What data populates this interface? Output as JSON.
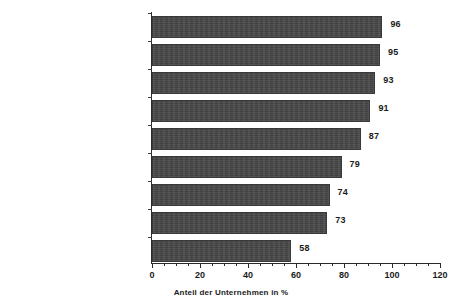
{
  "chart_data": {
    "type": "bar",
    "orientation": "horizontal",
    "title": "",
    "xlabel": "Anteil der Unternehmen  in %",
    "ylabel": "",
    "xlim": [
      0,
      120
    ],
    "xticks": [
      0,
      20,
      40,
      60,
      80,
      100,
      120
    ],
    "xtick_labels": [
      "0",
      "20",
      "40",
      "60",
      "80",
      "100",
      "120"
    ],
    "minor_tick_step": 5,
    "grid": false,
    "legend": false,
    "bar_color": "#474747",
    "categories": [
      "Bekanntheit steigern",
      "Stammkundenpflege",
      "Neukundengewinnung",
      "Imageverbesserung\nUnternehmen, Marken",
      "Präsentation neuer\nProdukte, Leistungen",
      "Erschließung neuer Märkte",
      "Neue Kooperationspartner",
      "Verkaufs- und Vertragsabschlüsse",
      "Aufbau neuer Vertriebswege"
    ],
    "values": [
      96,
      95,
      93,
      91,
      87,
      79,
      74,
      73,
      58
    ],
    "value_labels": [
      "96",
      "95",
      "93",
      "91",
      "87",
      "79",
      "74",
      "73",
      "58"
    ]
  }
}
